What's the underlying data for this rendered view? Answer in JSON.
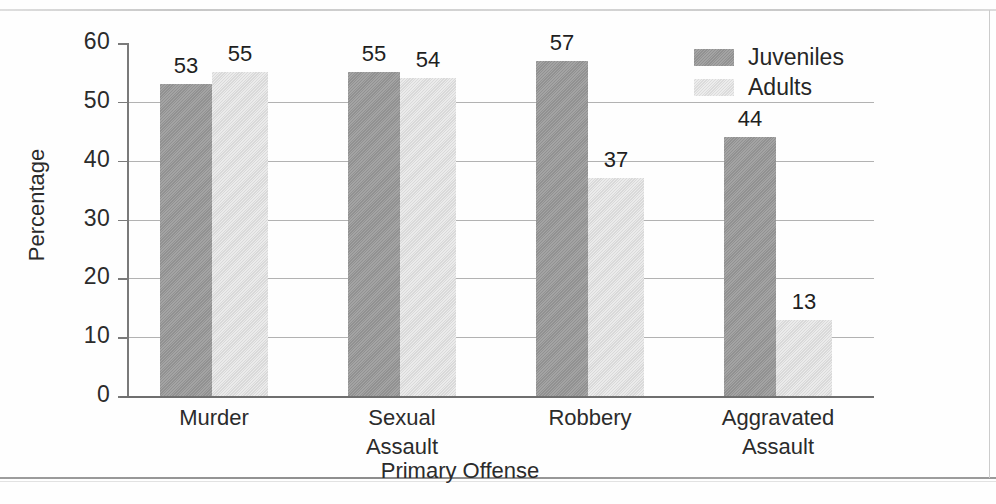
{
  "chart_data": {
    "type": "bar",
    "title": "",
    "xlabel": "Primary Offense",
    "ylabel": "Percentage",
    "categories": [
      "Murder",
      "Sexual Assault",
      "Robbery",
      "Aggravated Assault"
    ],
    "category_lines": [
      [
        "Murder"
      ],
      [
        "Sexual",
        "Assault"
      ],
      [
        "Robbery"
      ],
      [
        "Aggravated",
        "Assault"
      ]
    ],
    "series": [
      {
        "name": "Juveniles",
        "color": "#979797",
        "values": [
          53,
          55,
          57,
          44
        ]
      },
      {
        "name": "Adults",
        "color": "#e0e0e0",
        "values": [
          55,
          54,
          37,
          13
        ]
      }
    ],
    "ylim": [
      0,
      60
    ],
    "yticks": [
      0,
      10,
      20,
      30,
      40,
      50,
      60
    ],
    "ytick_labels": [
      "0",
      "10",
      "20",
      "30",
      "40",
      "50",
      "60"
    ],
    "grid": true,
    "grid_axis": "y",
    "legend_position": "top-right",
    "bar_value_labels": true
  },
  "axis": {
    "y_title": "Percentage",
    "x_title": "Primary Offense"
  },
  "legend": {
    "entries": [
      {
        "label": "Juveniles",
        "swatch": "juvenile-swatch"
      },
      {
        "label": "Adults",
        "swatch": "adult-swatch"
      }
    ]
  }
}
